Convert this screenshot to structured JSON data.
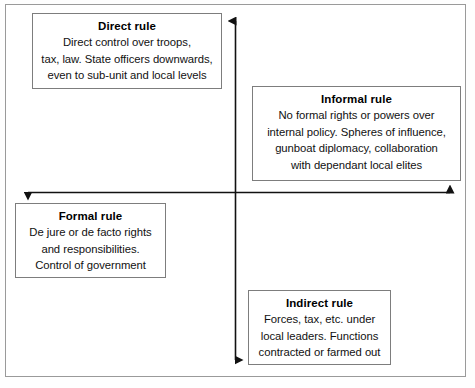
{
  "diagram": {
    "type": "two-axis-quadrant-diagram",
    "axes": {
      "vertical": {
        "name": "vertical-axis",
        "direction": "double-headed-up-down",
        "arrow_top": true,
        "arrow_bottom": true
      },
      "horizontal": {
        "name": "horizontal-axis",
        "direction": "double-headed-left-right",
        "arrow_left": true,
        "arrow_right": true
      }
    },
    "colors": {
      "background": "#ffffff",
      "frame_border": "#9a9a9a",
      "box_border": "#7d7d7d",
      "axis_line": "#111111",
      "text": "#000000"
    },
    "quadrants": [
      {
        "id": "direct-rule",
        "position": "top-left",
        "title": "Direct rule",
        "lines": [
          "Direct control over troops,",
          "tax, law. State officers downwards,",
          "even to sub-unit and local levels"
        ]
      },
      {
        "id": "informal-rule",
        "position": "top-right",
        "title": "Informal rule",
        "lines": [
          "No formal rights or powers over",
          "internal policy. Spheres of influence,",
          "gunboat diplomacy, collaboration",
          "with dependant local elites"
        ]
      },
      {
        "id": "formal-rule",
        "position": "bottom-left",
        "title": "Formal rule",
        "lines": [
          "De jure or de facto rights",
          "and responsibilities.",
          "Control of government"
        ]
      },
      {
        "id": "indirect-rule",
        "position": "bottom-right",
        "title": "Indirect rule",
        "lines": [
          "Forces, tax, etc. under",
          "local leaders. Functions",
          "contracted or farmed out"
        ]
      }
    ]
  }
}
